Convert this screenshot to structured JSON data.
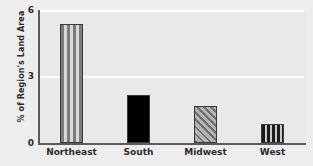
{
  "chart_data": {
    "type": "bar",
    "title": "",
    "xlabel": "",
    "ylabel": "% of Region's Land Area",
    "categories": [
      "Northeast",
      "South",
      "Midwest",
      "West"
    ],
    "values": [
      5.4,
      2.2,
      1.7,
      0.85
    ],
    "ylim": [
      0,
      6
    ],
    "yticks": [
      "0",
      "3",
      "6"
    ],
    "ytick_values": [
      0,
      3,
      6
    ],
    "grid": "horizontal-white-gridlines-at-3-and-6",
    "legend": "none",
    "series": [
      {
        "name": "% of Region's Land Area",
        "values": [
          5.4,
          2.2,
          1.7,
          0.85
        ]
      }
    ],
    "bars": [
      {
        "category": "Northeast",
        "value": 5.4,
        "fill": "vertical-stripes-gray"
      },
      {
        "category": "South",
        "value": 2.2,
        "fill": "solid-black"
      },
      {
        "category": "Midwest",
        "value": 1.7,
        "fill": "diagonal-hatch-gray"
      },
      {
        "category": "West",
        "value": 0.85,
        "fill": "vertical-stripes-dark"
      }
    ],
    "colors": {
      "background": "#ededed",
      "plot_area": "#e9e9e9",
      "axis": "#5a5a5a",
      "gridline": "#fdfdfd",
      "text": "#2b2b2b",
      "bar_black": "#000000",
      "bar_gray": "#7b7b7b",
      "bar_light": "#d8d8d8"
    }
  }
}
